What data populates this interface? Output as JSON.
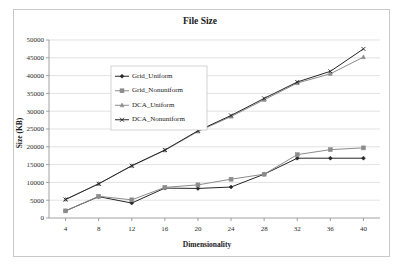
{
  "chart_data": {
    "type": "line",
    "title": "File Size",
    "xlabel": "Dimensionality",
    "ylabel": "Size (KB)",
    "x": [
      4,
      8,
      12,
      16,
      20,
      24,
      28,
      32,
      36,
      40
    ],
    "xticklabels": [
      "4",
      "8",
      "12",
      "16",
      "20",
      "24",
      "28",
      "32",
      "36",
      "40"
    ],
    "yticks": [
      0,
      5000,
      10000,
      15000,
      20000,
      25000,
      30000,
      35000,
      40000,
      45000,
      50000
    ],
    "yticklabels": [
      "0",
      "5000",
      "10000",
      "15000",
      "20000",
      "25000",
      "30000",
      "35000",
      "40000",
      "45000",
      "50000"
    ],
    "ylim": [
      0,
      50000
    ],
    "xlim": [
      2,
      42
    ],
    "grid": "horizontal",
    "legend_position": "upper-left-inside",
    "series": [
      {
        "name": "Grid_Uniform",
        "marker": "diamond",
        "color": "#262626",
        "values": [
          2000,
          6000,
          4200,
          8400,
          8300,
          8700,
          12300,
          16800,
          16800,
          16800
        ]
      },
      {
        "name": "Grid_Nonuniform",
        "marker": "square",
        "color": "#8c8c8c",
        "values": [
          2000,
          6100,
          5100,
          8600,
          9300,
          10900,
          12300,
          17800,
          19200,
          19700
        ]
      },
      {
        "name": "DCA_Uniform",
        "marker": "triangle",
        "color": "#8c8c8c",
        "values": [
          5200,
          9600,
          14600,
          19000,
          24300,
          28500,
          33200,
          37900,
          40500,
          45200
        ]
      },
      {
        "name": "DCA_Nonuniform",
        "marker": "cross",
        "color": "#262626",
        "values": [
          5200,
          9600,
          14700,
          19100,
          24500,
          28800,
          33600,
          38200,
          41200,
          47500
        ]
      }
    ]
  }
}
